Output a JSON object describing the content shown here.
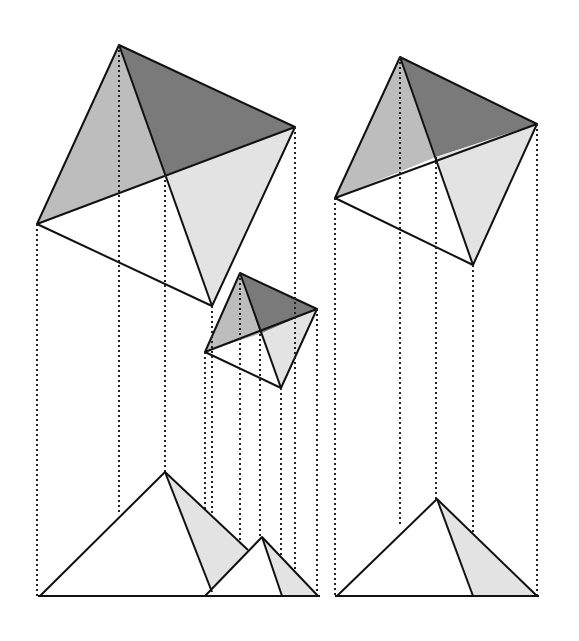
{
  "colors": {
    "dark": "#7a7a7a",
    "mid": "#bdbdbd",
    "light": "#e3e3e3",
    "white": "#ffffff",
    "line": "#111111"
  },
  "squares": [
    {
      "name": "large-square",
      "top": [
        119,
        45
      ],
      "right": [
        295,
        127
      ],
      "bottom": [
        212,
        306
      ],
      "left": [
        37,
        224
      ],
      "center": [
        165,
        175
      ]
    },
    {
      "name": "small-square",
      "top": [
        240,
        273
      ],
      "right": [
        317,
        309
      ],
      "bottom": [
        281,
        388
      ],
      "left": [
        205,
        352
      ],
      "center": [
        260,
        334
      ]
    },
    {
      "name": "right-square",
      "top": [
        400,
        57
      ],
      "right": [
        537,
        124
      ],
      "bottom": [
        473,
        265
      ],
      "left": [
        335,
        198
      ],
      "center": [
        436,
        157
      ]
    }
  ],
  "baseline_y": 596
}
